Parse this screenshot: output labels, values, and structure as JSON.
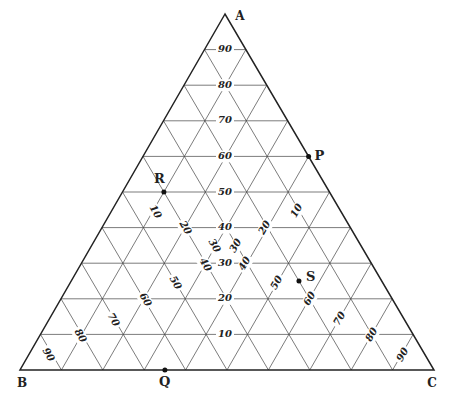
{
  "diagram": {
    "type": "ternary",
    "vertices": {
      "A": "A",
      "B": "B",
      "C": "C"
    },
    "a_axis_labels": [
      "10",
      "20",
      "30",
      "40",
      "50",
      "60",
      "70",
      "80",
      "90"
    ],
    "b_axis_labels": [
      "10",
      "20",
      "30",
      "40",
      "50",
      "60",
      "70",
      "80",
      "90"
    ],
    "c_axis_labels": [
      "10",
      "20",
      "30",
      "40",
      "50",
      "60",
      "70",
      "80",
      "90"
    ],
    "points": [
      {
        "name": "P",
        "a": 60,
        "b": 0,
        "c": 40
      },
      {
        "name": "R",
        "a": 50,
        "b": 40,
        "c": 10
      },
      {
        "name": "S",
        "a": 25,
        "b": 20,
        "c": 55
      },
      {
        "name": "Q",
        "a": 0,
        "b": 65,
        "c": 35
      }
    ],
    "colors": {
      "line": "#444444",
      "text": "#222222",
      "background": "#ffffff"
    }
  }
}
